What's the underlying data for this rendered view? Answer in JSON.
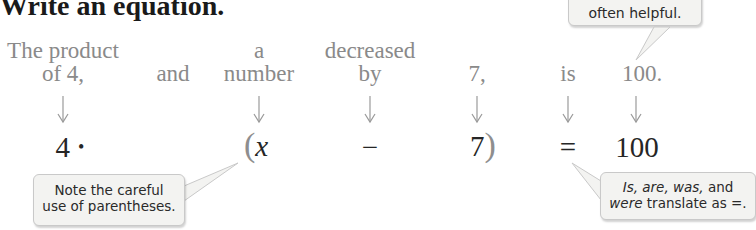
{
  "title": "Write an equation.",
  "phrases": [
    {
      "id": "product",
      "line1": "The product",
      "line2": "of 4,",
      "x": 63
    },
    {
      "id": "and",
      "line1": "",
      "line2": "and",
      "x": 173
    },
    {
      "id": "a-number",
      "line1": "a",
      "line2": "number",
      "x": 259
    },
    {
      "id": "decreased-by",
      "line1": "decreased",
      "line2": "by",
      "x": 370
    },
    {
      "id": "seven",
      "line1": "",
      "line2": "7,",
      "x": 477
    },
    {
      "id": "is",
      "line1": "",
      "line2": "is",
      "x": 568
    },
    {
      "id": "hundred",
      "line1": "",
      "line2": "100.",
      "x": 636
    }
  ],
  "equation": {
    "four": "4",
    "dot": "•",
    "open_paren": "(",
    "x": "x",
    "minus": "−",
    "seven": "7",
    "close_paren": ")",
    "equals": "=",
    "hundred": "100"
  },
  "callouts": {
    "top_right": {
      "text": "often helpful."
    },
    "bottom_left": {
      "line1": "Note the careful",
      "line2": "use of parentheses."
    },
    "bottom_right": {
      "line1_italic": "Is, are, was,",
      "line1_rest": " and",
      "line2_italic": "were",
      "line2_rest": " translate as =."
    }
  },
  "colors": {
    "phrase_text": "#8a8a8a",
    "equation_text": "#262626",
    "arrow": "#9a9a9a",
    "callout_bg": "#f3f3f1",
    "callout_border": "#c9c9c9"
  }
}
